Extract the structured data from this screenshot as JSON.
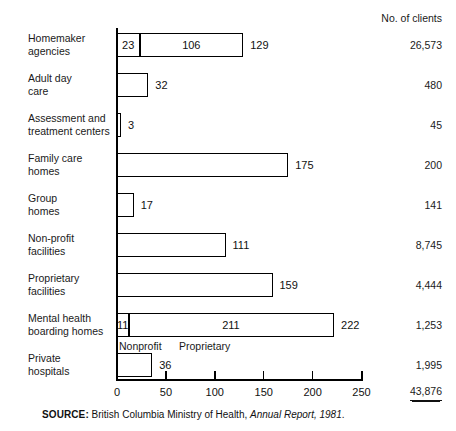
{
  "header": {
    "clients_column_label": "No. of clients"
  },
  "chart_data": {
    "type": "bar",
    "orientation": "horizontal",
    "title": "",
    "xlabel": "",
    "ylabel": "",
    "xlim": [
      0,
      250
    ],
    "xticks": [
      0,
      50,
      100,
      150,
      200,
      250
    ],
    "xtick_labels": [
      "0",
      "50",
      "100",
      "150",
      "200",
      "250"
    ],
    "grid": false,
    "legend_position": "inline-below-mental-health-bar",
    "categories": [
      "Homemaker agencies",
      "Adult day care",
      "Assessment and treatment centers",
      "Family care homes",
      "Group homes",
      "Non-profit facilities",
      "Proprietary facilities",
      "Mental health boarding homes",
      "Private hospitals"
    ],
    "values": [
      129,
      32,
      3,
      175,
      17,
      111,
      159,
      222,
      36
    ],
    "value_labels": [
      "129",
      "32",
      "3",
      "175",
      "17",
      "111",
      "159",
      "222",
      "36"
    ],
    "segments": {
      "Homemaker agencies": [
        {
          "name": "Nonprofit",
          "value": 23,
          "label": "23"
        },
        {
          "name": "Proprietary",
          "value": 106,
          "label": "106"
        }
      ],
      "Mental health boarding homes": [
        {
          "name": "Nonprofit",
          "value": 11,
          "label": "11"
        },
        {
          "name": "Proprietary",
          "value": 211,
          "label": "211"
        }
      ]
    },
    "segment_legend": [
      "Nonprofit",
      "Proprietary"
    ],
    "clients": [
      26573,
      480,
      45,
      200,
      141,
      8745,
      4444,
      1253,
      1995
    ],
    "clients_labels": [
      "26,573",
      "480",
      "45",
      "200",
      "141",
      "8,745",
      "4,444",
      "1,253",
      "1,995"
    ],
    "clients_total": 43876,
    "clients_total_label": "43,876"
  },
  "rows": [
    {
      "label_line1": "Homemaker",
      "label_line2": "agencies",
      "value": 129,
      "value_label": "129",
      "clients_label": "26,573",
      "segments": [
        {
          "name": "Nonprofit",
          "value": 23,
          "label": "23"
        },
        {
          "name": "Proprietary",
          "value": 106,
          "label": "106"
        }
      ]
    },
    {
      "label_line1": "Adult day",
      "label_line2": "care",
      "value": 32,
      "value_label": "32",
      "clients_label": "480",
      "segments": []
    },
    {
      "label_line1": "Assessment and",
      "label_line2": "treatment centers",
      "value": 3,
      "value_label": "3",
      "clients_label": "45",
      "segments": []
    },
    {
      "label_line1": "Family care",
      "label_line2": "homes",
      "value": 175,
      "value_label": "175",
      "clients_label": "200",
      "segments": []
    },
    {
      "label_line1": "Group",
      "label_line2": "homes",
      "value": 17,
      "value_label": "17",
      "clients_label": "141",
      "segments": []
    },
    {
      "label_line1": "Non-profit",
      "label_line2": "facilities",
      "value": 111,
      "value_label": "111",
      "clients_label": "8,745",
      "segments": []
    },
    {
      "label_line1": "Proprietary",
      "label_line2": "facilities",
      "value": 159,
      "value_label": "159",
      "clients_label": "4,444",
      "segments": []
    },
    {
      "label_line1": "Mental health",
      "label_line2": "boarding homes",
      "value": 222,
      "value_label": "222",
      "clients_label": "1,253",
      "segments": [
        {
          "name": "Nonprofit",
          "value": 11,
          "label": "11"
        },
        {
          "name": "Proprietary",
          "value": 211,
          "label": "211"
        }
      ]
    },
    {
      "label_line1": "Private",
      "label_line2": "hospitals",
      "value": 36,
      "value_label": "36",
      "clients_label": "1,995",
      "segments": []
    }
  ],
  "legend": {
    "nonprofit": "Nonprofit",
    "proprietary": "Proprietary"
  },
  "footer": {
    "source_keyword": "SOURCE:",
    "source_text": "British Columbia Ministry of Health,",
    "source_italic": "Annual Report, 1981",
    "source_period": "."
  },
  "axis": {
    "tick_labels": [
      "0",
      "50",
      "100",
      "150",
      "200",
      "250"
    ]
  },
  "colors": {
    "bar_fill": "#ffffff",
    "bar_stroke": "#000000",
    "text": "#1a1a1a",
    "background": "#ffffff"
  }
}
